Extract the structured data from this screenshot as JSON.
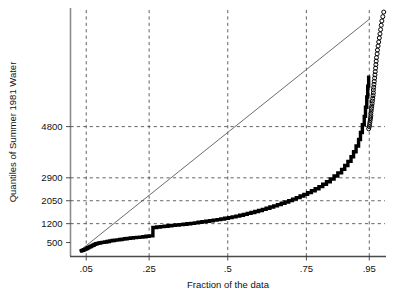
{
  "chart_data": {
    "type": "line",
    "title": "",
    "xlabel": "Fraction of the data",
    "ylabel": "Quantiles of Summer 1981 Water",
    "xlim": [
      0.0,
      1.0
    ],
    "ylim": [
      0,
      9200
    ],
    "grid": true,
    "legend": "none",
    "xticks": [
      0.05,
      0.25,
      0.5,
      0.75,
      0.95
    ],
    "xticklabels": [
      ".05",
      ".25",
      ".5",
      ".75",
      ".95"
    ],
    "yticks": [
      500,
      1200,
      2050,
      2900,
      4800
    ],
    "yticklabels": [
      "500",
      "1200",
      "2050",
      "2900",
      "4800"
    ],
    "annotations": [
      "thick stepped quantile (ECDF) curve",
      "thin straight reference line",
      "open circles mark upper-tail quantiles"
    ],
    "series": [
      {
        "name": "quantile-curve",
        "style": "step-thick",
        "x": [
          0.03,
          0.034,
          0.038,
          0.042,
          0.046,
          0.05,
          0.054,
          0.058,
          0.062,
          0.066,
          0.07,
          0.075,
          0.08,
          0.085,
          0.09,
          0.095,
          0.1,
          0.108,
          0.116,
          0.124,
          0.132,
          0.14,
          0.148,
          0.156,
          0.164,
          0.172,
          0.18,
          0.19,
          0.2,
          0.21,
          0.22,
          0.23,
          0.24,
          0.25,
          0.262,
          0.274,
          0.286,
          0.298,
          0.31,
          0.322,
          0.334,
          0.346,
          0.358,
          0.37,
          0.382,
          0.394,
          0.406,
          0.418,
          0.43,
          0.442,
          0.454,
          0.466,
          0.478,
          0.49,
          0.502,
          0.514,
          0.526,
          0.538,
          0.55,
          0.562,
          0.574,
          0.586,
          0.598,
          0.61,
          0.622,
          0.634,
          0.646,
          0.658,
          0.67,
          0.682,
          0.694,
          0.706,
          0.718,
          0.73,
          0.742,
          0.754,
          0.766,
          0.778,
          0.79,
          0.802,
          0.814,
          0.826,
          0.838,
          0.85,
          0.862,
          0.872,
          0.882,
          0.892,
          0.9,
          0.908,
          0.916,
          0.922,
          0.928,
          0.934,
          0.938,
          0.942,
          0.945,
          0.948
        ],
        "y": [
          180,
          200,
          215,
          235,
          255,
          280,
          305,
          330,
          350,
          375,
          400,
          430,
          455,
          470,
          485,
          495,
          505,
          520,
          540,
          560,
          575,
          590,
          600,
          610,
          625,
          640,
          655,
          670,
          680,
          690,
          700,
          715,
          730,
          745,
          1060,
          1075,
          1090,
          1105,
          1120,
          1135,
          1150,
          1165,
          1180,
          1195,
          1210,
          1230,
          1250,
          1270,
          1290,
          1310,
          1330,
          1350,
          1375,
          1400,
          1425,
          1450,
          1480,
          1510,
          1545,
          1580,
          1615,
          1650,
          1690,
          1730,
          1770,
          1815,
          1860,
          1905,
          1955,
          2005,
          2055,
          2110,
          2165,
          2225,
          2285,
          2350,
          2420,
          2495,
          2575,
          2660,
          2755,
          2855,
          2965,
          3085,
          3215,
          3355,
          3510,
          3680,
          3870,
          4080,
          4320,
          4580,
          4870,
          5180,
          5520,
          5900,
          6300,
          6700
        ]
      },
      {
        "name": "reference-line",
        "style": "thin-straight",
        "x": [
          0.028,
          0.952
        ],
        "y": [
          180,
          8800
        ]
      },
      {
        "name": "upper-tail-points",
        "style": "open-circles",
        "x": [
          0.948,
          0.95,
          0.951,
          0.952,
          0.953,
          0.954,
          0.955,
          0.955,
          0.956,
          0.957,
          0.958,
          0.959,
          0.96,
          0.961,
          0.962,
          0.963,
          0.963,
          0.964,
          0.965,
          0.966,
          0.967,
          0.968,
          0.969,
          0.97,
          0.971,
          0.972,
          0.973,
          0.975,
          0.976,
          0.978,
          0.98,
          0.982,
          0.984,
          0.986,
          0.988,
          0.99,
          0.993,
          0.996
        ],
        "y": [
          4720,
          4800,
          4880,
          4960,
          5040,
          5120,
          5200,
          5290,
          5380,
          5470,
          5560,
          5650,
          5750,
          5850,
          5950,
          6050,
          6160,
          6260,
          6370,
          6480,
          6600,
          6720,
          6840,
          6970,
          7100,
          7230,
          7360,
          7500,
          7640,
          7790,
          7940,
          8090,
          8240,
          8400,
          8560,
          8720,
          8880,
          9050
        ]
      }
    ]
  },
  "axes": {
    "y_axis_title": "Quantiles of Summer 1981 Water",
    "x_axis_title": "Fraction of the data"
  }
}
